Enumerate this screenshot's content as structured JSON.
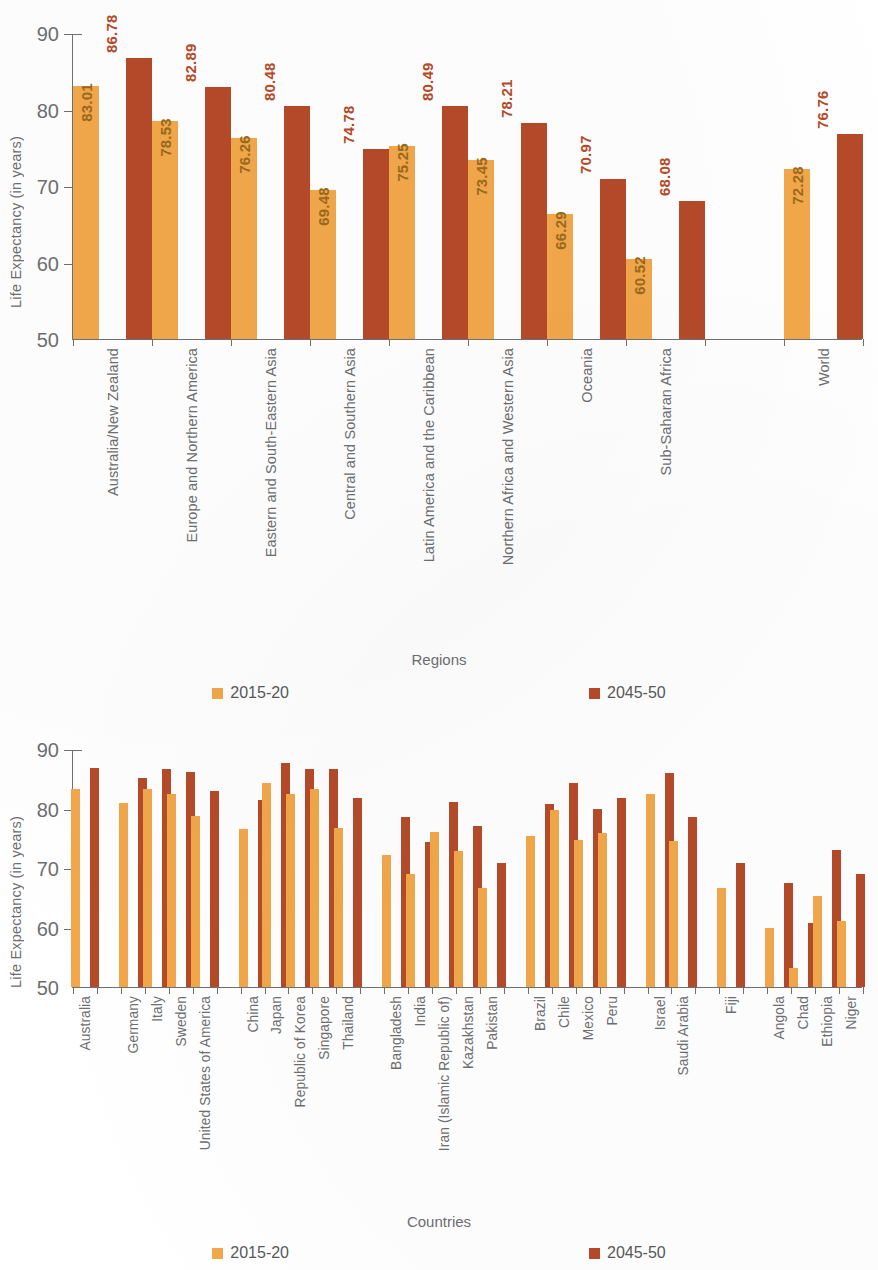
{
  "colors": {
    "series_2015_20": "#f2a74a",
    "series_2045_50": "#b54a28",
    "axis": "#6f7072",
    "text": "#6d6e71",
    "value_label_orange": "#9a6a1c",
    "value_label_red": "#b54a28"
  },
  "legend": {
    "items": [
      {
        "label": "2015-20",
        "color": "#f2a74a"
      },
      {
        "label": "2045-50",
        "color": "#b54a28"
      }
    ]
  },
  "chart_data": [
    {
      "type": "bar",
      "title": "",
      "xlabel": "Regions",
      "ylabel": "Life Expectancy (in years)",
      "ylim": [
        50,
        90
      ],
      "yticks": [
        50,
        60,
        70,
        80,
        90
      ],
      "grid": false,
      "legend_position": "bottom",
      "show_value_labels": true,
      "categories": [
        "Australia/New Zealand",
        "Europe and Northern America",
        "Eastern and South-Eastern Asia",
        "Central and Southern Asia",
        "Latin America and the Caribbean",
        "Northern Africa and Western Asia",
        "Oceania",
        "Sub-Saharan Africa",
        "",
        "World"
      ],
      "series": [
        {
          "name": "2015-20",
          "color": "#f2a74a",
          "values": [
            83.01,
            78.53,
            76.26,
            69.48,
            75.25,
            73.45,
            66.29,
            60.52,
            null,
            72.28
          ]
        },
        {
          "name": "2045-50",
          "color": "#b54a28",
          "values": [
            86.78,
            82.89,
            80.48,
            74.78,
            80.49,
            78.21,
            70.97,
            68.08,
            null,
            76.76
          ]
        }
      ]
    },
    {
      "type": "bar",
      "title": "",
      "xlabel": "Countries",
      "ylabel": "Life Expectancy (in years)",
      "ylim": [
        50,
        90
      ],
      "yticks": [
        50,
        60,
        70,
        80,
        90
      ],
      "grid": false,
      "legend_position": "bottom",
      "show_value_labels": false,
      "categories": [
        "Australia",
        "",
        "Germany",
        "Italy",
        "Sweden",
        "United States of America",
        "",
        "China",
        "Japan",
        "Republic of Korea",
        "Singapore",
        "Thailand",
        "",
        "Bangladesh",
        "India",
        "Iran (Islamic Republic of)",
        "Kazakhstan",
        "Pakistan",
        "",
        "Brazil",
        "Chile",
        "Mexico",
        "Peru",
        "",
        "Israel",
        "Saudi Arabia",
        "",
        "Fiji",
        "",
        "Angola",
        "Chad",
        "Ethiopia",
        "Niger"
      ],
      "series": [
        {
          "name": "2015-20",
          "color": "#f2a74a",
          "values": [
            83.3,
            null,
            81.0,
            83.3,
            82.4,
            78.8,
            null,
            76.5,
            84.3,
            82.5,
            83.2,
            76.8,
            null,
            72.2,
            69.0,
            76.1,
            72.8,
            66.7,
            null,
            75.3,
            79.8,
            74.7,
            75.9,
            null,
            82.4,
            74.5,
            null,
            66.7,
            null,
            60.0,
            53.2,
            65.3,
            61.1
          ]
        },
        {
          "name": "2045-50",
          "color": "#b54a28",
          "values": [
            86.8,
            null,
            85.2,
            86.7,
            86.2,
            83.0,
            null,
            81.4,
            87.7,
            86.7,
            86.7,
            81.8,
            null,
            78.5,
            74.4,
            81.1,
            77.0,
            70.8,
            null,
            80.7,
            84.3,
            79.9,
            81.8,
            null,
            85.9,
            78.6,
            null,
            70.8,
            null,
            67.4,
            60.7,
            73.0,
            69.0
          ]
        }
      ]
    }
  ]
}
